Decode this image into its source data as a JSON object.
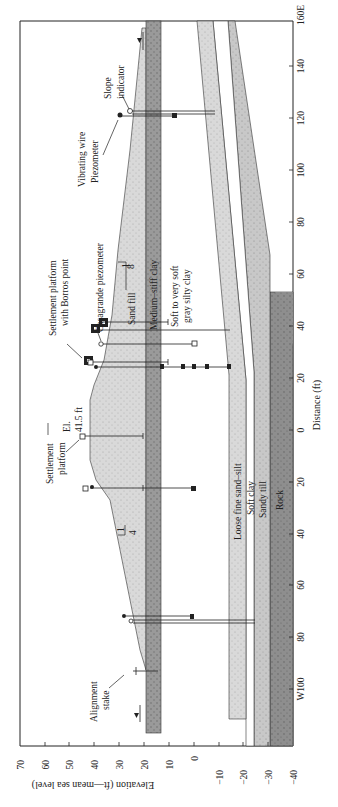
{
  "figure": {
    "orientation": "rotated-90",
    "colors": {
      "background": "#ffffff",
      "sand_fill": "#d8d8d8",
      "medium_stiff_clay": "#9a9a9a",
      "loose_fine_sand_silt": "#cfcfcf",
      "soft_clay": "#ffffff",
      "sandy_till": "#c4c4c4",
      "rock": "#8f8f8f",
      "line": "#222222"
    }
  },
  "axes": {
    "elevation": {
      "title": "Elevation (ft—mean sea level)",
      "ticks": [
        "70",
        "60",
        "50",
        "40",
        "30",
        "20",
        "10",
        "0",
        "−10",
        "−20",
        "−30",
        "−40"
      ],
      "range": [
        70,
        -40
      ]
    },
    "distance": {
      "title": "Distance (ft)",
      "ticks": [
        "160E",
        "140",
        "120",
        "100",
        "80",
        "60",
        "40",
        "20",
        "0",
        "20",
        "40",
        "60",
        "80",
        "W100"
      ],
      "range": [
        "160E",
        "W120"
      ]
    }
  },
  "layers": {
    "sand_fill": "Sand fill",
    "medium_stiff_clay": "Medium–stiff clay",
    "soft_gray_clay_line1": "Soft to very soft",
    "soft_gray_clay_line2": "gray silty clay",
    "loose_fine_sand_silt": "Loose fine sand–silt",
    "soft_clay": "Soft clay",
    "sandy_till": "Sandy till",
    "rock": "Rock"
  },
  "annotations": {
    "slope_indicator_line1": "Slope",
    "slope_indicator_line2": "indicator",
    "vibrating_wire_line1": "Vibrating wire",
    "vibrating_wire_line2": "Piezometer",
    "settlement_borros_line1": "Settlement platform",
    "settlement_borros_line2": "with Borros point",
    "casagrande": "Casagrande piezometer",
    "settlement_platform_line1": "Settlement",
    "settlement_platform_line2": "platform",
    "crest_elev_line1": "El.",
    "crest_elev_line2": "41.5 ft",
    "alignment_stake_line1": "Alignment",
    "alignment_stake_line2": "stake",
    "slope_right_run": "8",
    "slope_right_rise": "1",
    "slope_left_run": "4",
    "slope_left_rise": "1"
  }
}
